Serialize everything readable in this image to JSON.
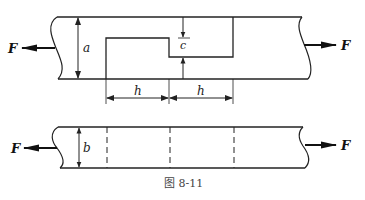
{
  "figure": {
    "caption": "图 8-11",
    "colors": {
      "line": "#222222",
      "background": "#ffffff",
      "caption": "#444444"
    }
  },
  "top_view": {
    "force_left_label": "F",
    "force_right_label": "F",
    "width_label": "a",
    "gap_label": "c",
    "length_labels": [
      "h",
      "h"
    ]
  },
  "bottom_view": {
    "force_left_label": "F",
    "force_right_label": "F",
    "thickness_label": "b"
  }
}
